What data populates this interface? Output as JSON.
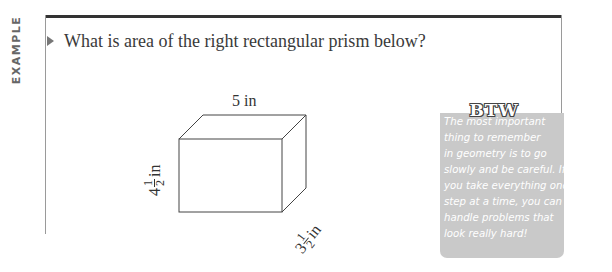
{
  "section_label": "EXAMPLE",
  "question": "What is area of the right rectangular prism below?",
  "figure": {
    "shape": "right rectangular prism",
    "length_label": "5 in",
    "height_label": {
      "whole": "4",
      "numerator": "1",
      "denominator": "2",
      "unit": "in"
    },
    "depth_label": {
      "whole": "3",
      "numerator": "1",
      "denominator": "2",
      "unit": "in"
    }
  },
  "sidebar": {
    "title": "BTW",
    "lines": [
      "The most important",
      "thing to remember",
      "in geometry is to go",
      "slowly and be careful. If",
      "you take everything one",
      "step at a time, you can",
      "handle problems that",
      "look really hard!"
    ],
    "background_color": "#c9c9c9"
  }
}
